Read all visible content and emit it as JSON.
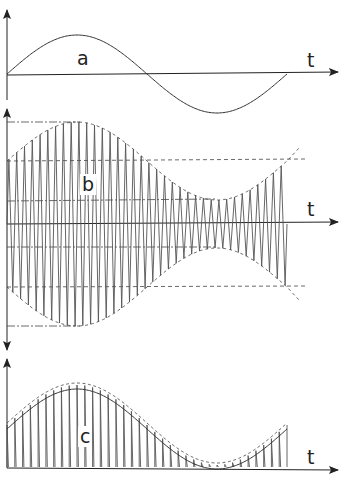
{
  "figure": {
    "panels": [
      {
        "id": "a",
        "label": "a",
        "axis_label": "t",
        "description": "modulating sine signal (one period)"
      },
      {
        "id": "b",
        "label": "b",
        "axis_label": "t",
        "description": "amplitude-modulated carrier with envelope and dash-dot reference lines"
      },
      {
        "id": "c",
        "label": "c",
        "axis_label": "t",
        "description": "rectified/sampled pulses following the envelope with dashed bounds"
      }
    ],
    "colors": {
      "line": "#333333",
      "carrier": "#555555",
      "background": "#ffffff"
    }
  }
}
